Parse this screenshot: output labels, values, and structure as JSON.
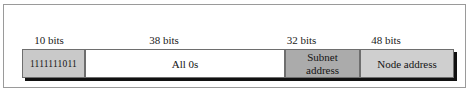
{
  "figure": {
    "type": "bit-field-diagram",
    "total_bits": 128,
    "frame_color": "#9a9a9a"
  },
  "bit_labels": [
    {
      "text": "10 bits"
    },
    {
      "text": "38 bits"
    },
    {
      "text": "32 bits"
    },
    {
      "text": "48 bits"
    }
  ],
  "fields": [
    {
      "name": "prefix",
      "value": "1111111011",
      "bits": "10 bits",
      "fill": "#c9c9c9"
    },
    {
      "name": "all-zeros",
      "value": "All 0s",
      "bits": "38 bits",
      "fill": "#ffffff"
    },
    {
      "name": "subnet-address",
      "value_line1": "Subnet",
      "value_line2": "address",
      "bits": "32 bits",
      "fill": "#ababab"
    },
    {
      "name": "node-address",
      "value": "Node address",
      "bits": "48 bits",
      "fill": "#cfcfcf"
    }
  ]
}
